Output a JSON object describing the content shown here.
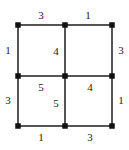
{
  "figure": {
    "name": "weighted-2x2-grid-graph",
    "type": "graph-diagram",
    "background_color": "#ffffff",
    "edge_color": "#555555",
    "vertex_color": "#111111",
    "label_color": "#1a1a1a",
    "width": 129,
    "height": 150
  },
  "graph_data": {
    "type": "grid-graph",
    "rows": 3,
    "cols": 3,
    "vertices": [
      {
        "id": "v00",
        "row": 0,
        "col": 0,
        "x": 18,
        "y": 25
      },
      {
        "id": "v01",
        "row": 0,
        "col": 1,
        "x": 65,
        "y": 25
      },
      {
        "id": "v02",
        "row": 0,
        "col": 2,
        "x": 112,
        "y": 25
      },
      {
        "id": "v10",
        "row": 1,
        "col": 0,
        "x": 18,
        "y": 76
      },
      {
        "id": "v11",
        "row": 1,
        "col": 1,
        "x": 65,
        "y": 76
      },
      {
        "id": "v12",
        "row": 1,
        "col": 2,
        "x": 112,
        "y": 76
      },
      {
        "id": "v20",
        "row": 2,
        "col": 0,
        "x": 18,
        "y": 126
      },
      {
        "id": "v21",
        "row": 2,
        "col": 1,
        "x": 65,
        "y": 126
      },
      {
        "id": "v22",
        "row": 2,
        "col": 2,
        "x": 112,
        "y": 126
      }
    ],
    "edges": [
      {
        "id": "e-top-left",
        "from": "v00",
        "to": "v01",
        "orientation": "horizontal",
        "weight": 3,
        "label_x": 41,
        "label_y": 16
      },
      {
        "id": "e-top-right",
        "from": "v01",
        "to": "v02",
        "orientation": "horizontal",
        "weight": 1,
        "label_x": 88,
        "label_y": 16
      },
      {
        "id": "e-left-upper",
        "from": "v00",
        "to": "v10",
        "orientation": "vertical",
        "weight": 1,
        "label_x": 8,
        "label_y": 51
      },
      {
        "id": "e-mid-vert-upper",
        "from": "v01",
        "to": "v11",
        "orientation": "vertical",
        "weight": 4,
        "label_x": 56,
        "label_y": 52
      },
      {
        "id": "e-right-upper",
        "from": "v02",
        "to": "v12",
        "orientation": "vertical",
        "weight": 3,
        "label_x": 121,
        "label_y": 51
      },
      {
        "id": "e-mid-horz-left",
        "from": "v10",
        "to": "v11",
        "orientation": "horizontal",
        "weight": 5,
        "label_x": 41,
        "label_y": 88
      },
      {
        "id": "e-mid-horz-right",
        "from": "v11",
        "to": "v12",
        "orientation": "horizontal",
        "weight": 4,
        "label_x": 90,
        "label_y": 88
      },
      {
        "id": "e-left-lower",
        "from": "v10",
        "to": "v20",
        "orientation": "vertical",
        "weight": 3,
        "label_x": 8,
        "label_y": 101
      },
      {
        "id": "e-mid-vert-lower",
        "from": "v11",
        "to": "v21",
        "orientation": "vertical",
        "weight": 5,
        "label_x": 56,
        "label_y": 104
      },
      {
        "id": "e-right-lower",
        "from": "v12",
        "to": "v22",
        "orientation": "vertical",
        "weight": 1,
        "label_x": 121,
        "label_y": 101
      },
      {
        "id": "e-bottom-left",
        "from": "v20",
        "to": "v21",
        "orientation": "horizontal",
        "weight": 1,
        "label_x": 41,
        "label_y": 138
      },
      {
        "id": "e-bottom-right",
        "from": "v21",
        "to": "v22",
        "orientation": "horizontal",
        "weight": 3,
        "label_x": 90,
        "label_y": 138
      }
    ]
  }
}
